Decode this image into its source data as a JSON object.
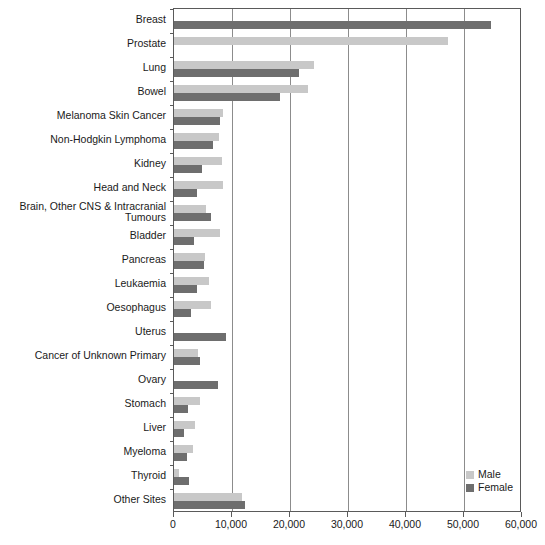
{
  "chart_data": {
    "type": "bar",
    "orientation": "horizontal",
    "title": "",
    "xlabel": "",
    "ylabel": "",
    "xlim": [
      0,
      60000
    ],
    "xticks": [
      0,
      10000,
      20000,
      30000,
      40000,
      50000,
      60000
    ],
    "xtick_labels": [
      "0",
      "10,000",
      "20,000",
      "30,000",
      "40,000",
      "50,000",
      "60,000"
    ],
    "grid": "vertical",
    "legend_position": "bottom-right",
    "categories": [
      "Breast",
      "Prostate",
      "Lung",
      "Bowel",
      "Melanoma Skin Cancer",
      "Non-Hodgkin Lymphoma",
      "Kidney",
      "Head and Neck",
      "Brain, Other CNS & Intracranial\nTumours",
      "Bladder",
      "Pancreas",
      "Leukaemia",
      "Oesophagus",
      "Uterus",
      "Cancer of Unknown Primary",
      "Ovary",
      "Stomach",
      "Liver",
      "Myeloma",
      "Thyroid",
      "Other Sites"
    ],
    "series": [
      {
        "name": "Male",
        "color": "#c8c8c8",
        "values": [
          0,
          47300,
          24200,
          23100,
          8400,
          7700,
          8200,
          8500,
          5500,
          8000,
          5400,
          6100,
          6300,
          0,
          4100,
          0,
          4400,
          3700,
          3200,
          800,
          11700
        ]
      },
      {
        "name": "Female",
        "color": "#6e6e6e",
        "values": [
          54700,
          0,
          21500,
          18200,
          8000,
          6800,
          4800,
          3900,
          6400,
          3400,
          5200,
          4000,
          2900,
          8900,
          4500,
          7500,
          2400,
          1800,
          2200,
          2500,
          12200
        ]
      }
    ]
  },
  "legend": {
    "items": [
      {
        "label": "Male",
        "color": "#c8c8c8"
      },
      {
        "label": "Female",
        "color": "#6e6e6e"
      }
    ]
  }
}
